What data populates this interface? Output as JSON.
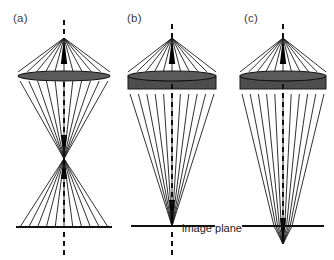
{
  "figure": {
    "labels": {
      "panel_a": "(a)",
      "panel_b": "(b)",
      "panel_c": "(c)",
      "image_plane": "image plane"
    },
    "colors": {
      "ray": "#1a1a1a",
      "lens_fill": "#5a5a5a",
      "lens_block": "#4d4d4d",
      "axis": "#111111",
      "background": "#ffffff",
      "text": "#1a1a1a"
    }
  },
  "chart_data": {
    "type": "diagram",
    "subtitle": "",
    "xlabel": "",
    "ylabel": "",
    "grid": false,
    "legend": "none",
    "canvas": {
      "width": 334,
      "height": 260
    },
    "annotations": [
      "(a)",
      "(b)",
      "(c)",
      "image plane"
    ],
    "panels": [
      {
        "id": "a",
        "label": "(a)",
        "label_xy": [
          13,
          12
        ],
        "axis_x": 64,
        "source_apex_xy": [
          64,
          38
        ],
        "lens": {
          "type": "thin-ellipse",
          "x_left": 18,
          "x_right": 110,
          "center_y": 76,
          "ellipse_ry": 5,
          "block_height": 0
        },
        "crossover_y": 157,
        "crossover_present": true,
        "plane": {
          "y": 227,
          "x_left": 16,
          "x_right": 112
        },
        "focus_relative_to_plane": "crossover above plane, rays diverge onto plane",
        "ray_count": 11,
        "ray_half_spread_at_lens": 46,
        "ray_half_spread_at_plane": 44,
        "dashed_axis_segments": [
          [
            20,
            38
          ],
          [
            82,
            150
          ],
          [
            164,
            222
          ],
          [
            232,
            256
          ]
        ]
      },
      {
        "id": "b",
        "label": "(b)",
        "label_xy": [
          127,
          12
        ],
        "axis_x": 172,
        "source_apex_xy": [
          172,
          38
        ],
        "lens": {
          "type": "ellipse-with-block",
          "x_left": 128,
          "x_right": 216,
          "center_y": 76,
          "ellipse_ry": 5,
          "block_height": 13
        },
        "crossover_y": 226,
        "crossover_present": false,
        "plane": {
          "y": 226,
          "x_left": 131,
          "x_right": 215
        },
        "focus_relative_to_plane": "focus exactly on image plane",
        "ray_count": 11,
        "ray_half_spread_at_lens": 44,
        "ray_half_spread_at_plane": 0,
        "dashed_axis_segments": [
          [
            24,
            38
          ],
          [
            84,
            220
          ],
          [
            232,
            256
          ]
        ]
      },
      {
        "id": "c",
        "label": "(c)",
        "label_xy": [
          244,
          12
        ],
        "axis_x": 283,
        "source_apex_xy": [
          283,
          38
        ],
        "lens": {
          "type": "ellipse-with-block",
          "x_left": 240,
          "x_right": 326,
          "center_y": 76,
          "ellipse_ry": 5,
          "block_height": 13
        },
        "crossover_y": 244,
        "crossover_present": true,
        "plane": {
          "y": 226,
          "x_left": 242,
          "x_right": 324
        },
        "focus_relative_to_plane": "focus below image plane (defocus)",
        "ray_count": 11,
        "ray_half_spread_at_lens": 43,
        "ray_half_spread_at_plane": 9,
        "dashed_axis_segments": [
          [
            24,
            38
          ],
          [
            84,
            225
          ]
        ]
      }
    ]
  }
}
